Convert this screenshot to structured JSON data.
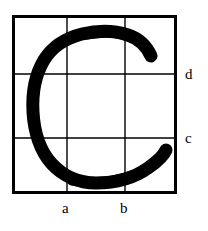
{
  "figure": {
    "kind": "handwritten-character-on-grid",
    "character": "C",
    "background_color": "#ffffff",
    "ink_color": "#000000",
    "grid": {
      "outer_border_color": "#000000",
      "outer_border_width": 3,
      "inner_line_color": "#000000",
      "inner_line_width": 1.4,
      "columns": 3,
      "rows": 3,
      "box": {
        "left": 12,
        "top": 15,
        "right": 177,
        "bottom": 194
      },
      "vertical_lines_x": [
        67,
        125
      ],
      "horizontal_lines_y": [
        74,
        138
      ]
    },
    "labels": {
      "bottom": [
        {
          "text": "a",
          "name": "grid-label-a",
          "x": 69,
          "y": 209
        },
        {
          "text": "b",
          "name": "grid-label-b",
          "x": 127,
          "y": 209
        }
      ],
      "right": [
        {
          "text": "d",
          "name": "grid-label-d",
          "x": 189,
          "y": 74
        },
        {
          "text": "c",
          "name": "grid-label-c",
          "x": 189,
          "y": 138
        }
      ]
    },
    "stroke": {
      "name": "letter-c-stroke",
      "cap": "round",
      "join": "round",
      "width": 13,
      "extents": {
        "left": 30,
        "top": 31,
        "right": 167,
        "bottom": 183
      },
      "upper_terminal": {
        "x": 151,
        "y": 57
      },
      "lower_terminal": {
        "x": 166,
        "y": 150
      },
      "path": "M 151 56 C 147 47 140 39 128 35 C 113 30 95 31 82 34 C 66 38 52 47 44 60 C 35 75 32 94 33 112 C 34 131 40 151 52 164 C 63 176 79 183 96 183 C 115 183 134 178 148 168 C 158 161 164 155 166 150"
    }
  }
}
